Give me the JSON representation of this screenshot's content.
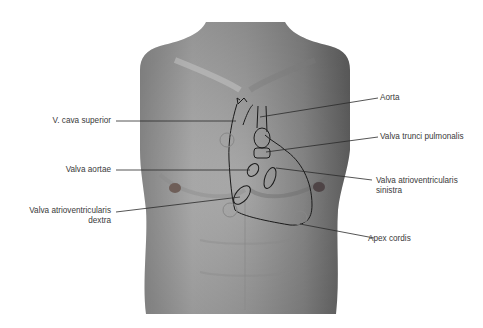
{
  "figure": {
    "colors": {
      "background": "#ffffff",
      "skin_light": "#b8b8b8",
      "skin_dark": "#6e6e6e",
      "outline": "#1a1a1a",
      "label_text": "#3a3a3a",
      "leader_line": "#2a2a2a"
    }
  },
  "labels": {
    "vena_cava": "V. cava superior",
    "valva_aortae": "Valva aortae",
    "valva_av_dextra_1": "Valva atrioventricularis",
    "valva_av_dextra_2": "dextra",
    "aorta": "Aorta",
    "valva_trunci": "Valva trunci pulmonalis",
    "valva_av_sinistra_1": "Valva atrioventricularis",
    "valva_av_sinistra_2": "sinistra",
    "apex": "Apex cordis"
  }
}
